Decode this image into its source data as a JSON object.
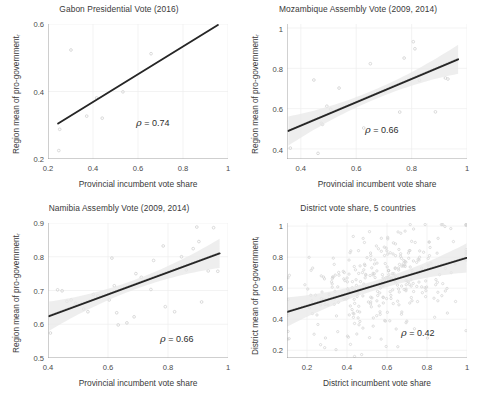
{
  "figure": {
    "width": 477,
    "height": 399,
    "background": "#ffffff",
    "layout": "2x2 grid of scatter plots",
    "point_color": "#d3d3d3",
    "line_color": "#262626",
    "band_color": "#e8e8e8",
    "grid_color": "#eeeeee",
    "axis_color": "#9a9a9a"
  },
  "chart_data": [
    {
      "type": "scatter",
      "panel_id": "gabon",
      "title": "Gabon Presidential Vote (2016)",
      "xlabel": "Provincial incumbent vote share",
      "ylabel": "Region mean of pro-government",
      "ylabel_subscript": "r",
      "xlim": [
        0.2,
        1.0
      ],
      "ylim": [
        0.2,
        0.6
      ],
      "xticks": [
        0.2,
        0.4,
        0.6,
        0.8,
        1
      ],
      "xticklabels": [
        "0.2",
        "0.4",
        "0.6",
        "0.8",
        "1"
      ],
      "yticks": [
        0.2,
        0.4,
        0.6
      ],
      "yticklabels": [
        "0.2",
        "0.4",
        "0.6"
      ],
      "grid": true,
      "legend": "none",
      "annotation": "ρ = 0.74",
      "rho": 0.74,
      "fit_line": {
        "x": [
          0.245,
          0.955
        ],
        "y": [
          0.305,
          0.597
        ]
      },
      "confidence_band": false,
      "points": [
        {
          "x": 0.248,
          "y": 0.225
        },
        {
          "x": 0.252,
          "y": 0.288
        },
        {
          "x": 0.302,
          "y": 0.523
        },
        {
          "x": 0.372,
          "y": 0.327
        },
        {
          "x": 0.416,
          "y": 0.381
        },
        {
          "x": 0.441,
          "y": 0.321
        },
        {
          "x": 0.533,
          "y": 0.399
        },
        {
          "x": 0.658,
          "y": 0.512
        }
      ]
    },
    {
      "type": "scatter",
      "panel_id": "mozambique",
      "title": "Mozambique Assembly Vote (2009, 2014)",
      "xlabel": "Provincial incumbent vote share",
      "ylabel": "Region mean of pro-government",
      "ylabel_subscript": "r",
      "xlim": [
        0.35,
        1.0
      ],
      "ylim": [
        0.35,
        1.02
      ],
      "xticks": [
        0.4,
        0.6,
        0.8,
        1
      ],
      "xticklabels": [
        "0.4",
        "0.6",
        "0.8",
        "1"
      ],
      "yticks": [
        0.4,
        0.6,
        0.8,
        1
      ],
      "yticklabels": [
        "0.4",
        "0.6",
        "0.8",
        "1"
      ],
      "grid": true,
      "legend": "none",
      "annotation": "ρ = 0.66",
      "rho": 0.66,
      "fit_line": {
        "x": [
          0.355,
          0.968
        ],
        "y": [
          0.489,
          0.845
        ]
      },
      "confidence_band": true,
      "points": [
        {
          "x": 0.362,
          "y": 0.404
        },
        {
          "x": 0.447,
          "y": 0.742
        },
        {
          "x": 0.462,
          "y": 0.378
        },
        {
          "x": 0.474,
          "y": 0.527
        },
        {
          "x": 0.478,
          "y": 0.522
        },
        {
          "x": 0.494,
          "y": 0.612
        },
        {
          "x": 0.508,
          "y": 0.597
        },
        {
          "x": 0.538,
          "y": 0.702
        },
        {
          "x": 0.627,
          "y": 0.504
        },
        {
          "x": 0.651,
          "y": 0.823
        },
        {
          "x": 0.703,
          "y": 0.688
        },
        {
          "x": 0.757,
          "y": 0.583
        },
        {
          "x": 0.773,
          "y": 0.851
        },
        {
          "x": 0.806,
          "y": 0.932
        },
        {
          "x": 0.812,
          "y": 0.897
        },
        {
          "x": 0.828,
          "y": 0.741
        },
        {
          "x": 0.886,
          "y": 0.584
        },
        {
          "x": 0.922,
          "y": 0.752
        },
        {
          "x": 0.931,
          "y": 0.747
        }
      ]
    },
    {
      "type": "scatter",
      "panel_id": "namibia",
      "title": "Namibia Assembly Vote (2009, 2014)",
      "xlabel": "Provincial incumbent vote share",
      "ylabel": "Region mean of pro-government",
      "ylabel_subscript": "r",
      "xlim": [
        0.4,
        1.0
      ],
      "ylim": [
        0.5,
        0.9
      ],
      "xticks": [
        0.4,
        0.6,
        0.8,
        1
      ],
      "xticklabels": [
        "0.4",
        "0.6",
        "0.8",
        "1"
      ],
      "yticks": [
        0.5,
        0.6,
        0.7,
        0.8,
        0.9
      ],
      "yticklabels": [
        "0.5",
        "0.6",
        "0.7",
        "0.8",
        "0.9"
      ],
      "grid": true,
      "legend": "none",
      "annotation": "ρ = 0.66",
      "rho": 0.66,
      "fit_line": {
        "x": [
          0.404,
          0.972
        ],
        "y": [
          0.624,
          0.81
        ]
      },
      "confidence_band": true,
      "points": [
        {
          "x": 0.408,
          "y": 0.574
        },
        {
          "x": 0.432,
          "y": 0.702
        },
        {
          "x": 0.447,
          "y": 0.699
        },
        {
          "x": 0.463,
          "y": 0.668
        },
        {
          "x": 0.477,
          "y": 0.672
        },
        {
          "x": 0.492,
          "y": 0.662
        },
        {
          "x": 0.519,
          "y": 0.645
        },
        {
          "x": 0.533,
          "y": 0.637
        },
        {
          "x": 0.551,
          "y": 0.688
        },
        {
          "x": 0.566,
          "y": 0.684
        },
        {
          "x": 0.604,
          "y": 0.672
        },
        {
          "x": 0.613,
          "y": 0.796
        },
        {
          "x": 0.621,
          "y": 0.714
        },
        {
          "x": 0.629,
          "y": 0.634
        },
        {
          "x": 0.634,
          "y": 0.598
        },
        {
          "x": 0.663,
          "y": 0.604
        },
        {
          "x": 0.687,
          "y": 0.622
        },
        {
          "x": 0.693,
          "y": 0.75
        },
        {
          "x": 0.711,
          "y": 0.739
        },
        {
          "x": 0.743,
          "y": 0.703
        },
        {
          "x": 0.752,
          "y": 0.789
        },
        {
          "x": 0.784,
          "y": 0.832
        },
        {
          "x": 0.791,
          "y": 0.652
        },
        {
          "x": 0.822,
          "y": 0.637
        },
        {
          "x": 0.845,
          "y": 0.8
        },
        {
          "x": 0.861,
          "y": 0.761
        },
        {
          "x": 0.884,
          "y": 0.824
        },
        {
          "x": 0.896,
          "y": 0.888
        },
        {
          "x": 0.903,
          "y": 0.845
        },
        {
          "x": 0.912,
          "y": 0.666
        },
        {
          "x": 0.934,
          "y": 0.758
        },
        {
          "x": 0.952,
          "y": 0.886
        },
        {
          "x": 0.966,
          "y": 0.757
        }
      ]
    },
    {
      "type": "scatter",
      "panel_id": "district",
      "title": "District vote share, 5 countries",
      "xlabel": "District incumbent vote share",
      "ylabel": "District mean of pro-government",
      "ylabel_subscript": "i",
      "xlim": [
        0.1,
        1.0
      ],
      "ylim": [
        0.15,
        1.02
      ],
      "xticks": [
        0.2,
        0.4,
        0.6,
        0.8,
        1
      ],
      "xticklabels": [
        "0.2",
        "0.4",
        "0.6",
        "0.8",
        "1"
      ],
      "yticks": [
        0.2,
        0.4,
        0.6,
        0.8,
        1
      ],
      "yticklabels": [
        "0.2",
        "0.4",
        "0.6",
        "0.8",
        "1"
      ],
      "grid": true,
      "legend": "none",
      "annotation": "ρ = 0.42",
      "rho": 0.42,
      "fit_line": {
        "x": [
          0.102,
          0.998
        ],
        "y": [
          0.447,
          0.795
        ]
      },
      "confidence_band": true,
      "n_points": 330,
      "points_note": "dense cloud, ~330 light gray markers generated from the stated correlation",
      "points_seed": 20231,
      "points_model": {
        "x_mean": 0.58,
        "x_sd": 0.19,
        "y_mean": 0.645,
        "y_sd": 0.185,
        "r": 0.42
      }
    }
  ]
}
